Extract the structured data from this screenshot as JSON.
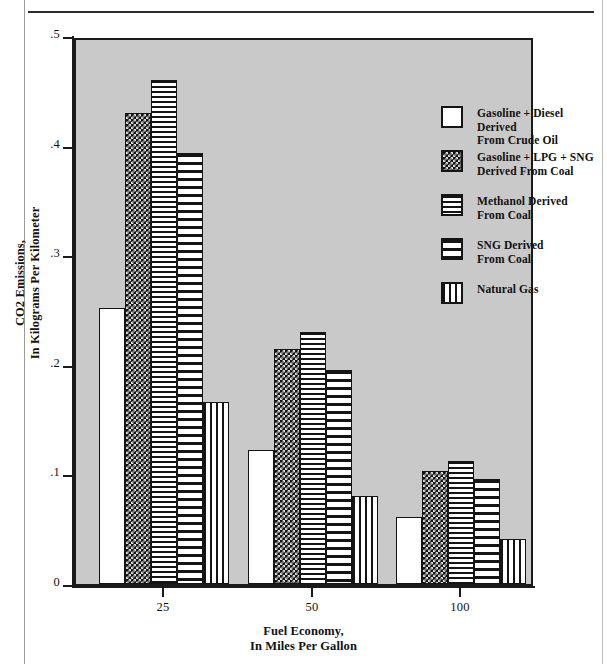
{
  "chart_data": {
    "type": "bar",
    "title": "",
    "subtitle": "",
    "xlabel": "Fuel Economy,\nIn Miles Per Gallon",
    "ylabel": "CO2 Emissions,\nIn Kilograms Per Kilometer",
    "categories": [
      "25",
      "50",
      "100"
    ],
    "x_tick_labels": [
      "25",
      "50",
      "100"
    ],
    "y_tick_labels": [
      "0",
      ".1",
      ".2",
      ".3",
      ".4",
      ".5"
    ],
    "y_tick_values": [
      0,
      0.1,
      0.2,
      0.3,
      0.4,
      0.5
    ],
    "ylim": [
      0,
      0.5
    ],
    "grid": false,
    "legend_position": "upper-right-inside",
    "plot_background": "#c9c9c9",
    "series": [
      {
        "name": "Gasoline + Diesel Derived\nFrom Crude Oil",
        "pattern": "solid-white",
        "values": [
          0.252,
          0.122,
          0.061
        ]
      },
      {
        "name": "Gasoline + LPG + SNG\nDerived From Coal",
        "pattern": "checker",
        "values": [
          0.43,
          0.214,
          0.103
        ]
      },
      {
        "name": "Methanol Derived\nFrom Coal",
        "pattern": "hline-fine",
        "values": [
          0.46,
          0.23,
          0.112
        ]
      },
      {
        "name": "SNG Derived\nFrom Coal",
        "pattern": "hline-coarse",
        "values": [
          0.393,
          0.195,
          0.096
        ]
      },
      {
        "name": "Natural Gas",
        "pattern": "vline",
        "values": [
          0.166,
          0.08,
          0.041
        ]
      }
    ]
  },
  "axis": {
    "y_title": "CO2 Emissions,\nIn Kilograms Per Kilometer",
    "x_title": "Fuel Economy,\nIn Miles Per Gallon"
  },
  "legend": {
    "items": [
      {
        "label": "Gasoline + Diesel Derived\nFrom Crude Oil",
        "pattern": "solid-white"
      },
      {
        "label": "Gasoline + LPG + SNG\nDerived From Coal",
        "pattern": "checker"
      },
      {
        "label": "Methanol Derived\nFrom Coal",
        "pattern": "hline-fine"
      },
      {
        "label": "SNG Derived\nFrom Coal",
        "pattern": "hline-coarse"
      },
      {
        "label": "Natural Gas",
        "pattern": "vline"
      }
    ]
  },
  "colors": {
    "ink": "#141414",
    "plot_background": "#c9c9c9",
    "page_background": "#ffffff"
  }
}
